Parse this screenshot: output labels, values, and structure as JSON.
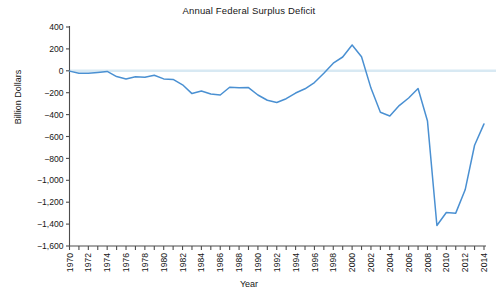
{
  "chart_data": {
    "type": "line",
    "title": "Annual Federal Surplus Deficit",
    "xlabel": "Year",
    "ylabel": "Billion Dollars",
    "grid": false,
    "legend": null,
    "legend_position": "none",
    "line_color": "#4a90d2",
    "zero_line_color": "#d8e9f3",
    "axis_color": "#4d4d4d",
    "xlim": [
      1970,
      2014
    ],
    "ylim": [
      -1600,
      400
    ],
    "x_tick_step": 1,
    "x_label_step": 2,
    "y_tick_step": 200,
    "x": [
      1970,
      1971,
      1972,
      1973,
      1974,
      1975,
      1976,
      1977,
      1978,
      1979,
      1980,
      1981,
      1982,
      1983,
      1984,
      1985,
      1986,
      1987,
      1988,
      1989,
      1990,
      1991,
      1992,
      1993,
      1994,
      1995,
      1996,
      1997,
      1998,
      1999,
      2000,
      2001,
      2002,
      2003,
      2004,
      2005,
      2006,
      2007,
      2008,
      2009,
      2010,
      2011,
      2012,
      2013,
      2014
    ],
    "values": [
      -3,
      -23,
      -23,
      -15,
      -6,
      -53,
      -74,
      -54,
      -59,
      -41,
      -74,
      -79,
      -128,
      -208,
      -185,
      -212,
      -221,
      -150,
      -155,
      -153,
      -221,
      -269,
      -290,
      -255,
      -203,
      -164,
      -107,
      -22,
      69,
      126,
      236,
      128,
      -158,
      -378,
      -413,
      -318,
      -248,
      -161,
      -459,
      -1413,
      -1294,
      -1300,
      -1087,
      -680,
      -485
    ],
    "xtick_labels": [
      "1970",
      "1972",
      "1974",
      "1976",
      "1978",
      "1980",
      "1982",
      "1984",
      "1986",
      "1988",
      "1990",
      "1992",
      "1994",
      "1996",
      "1998",
      "2000",
      "2002",
      "2004",
      "2006",
      "2008",
      "2010",
      "2012",
      "2014"
    ],
    "ytick_labels": [
      "400",
      "200",
      "0",
      "−200",
      "−400",
      "−600",
      "−800",
      "−1,000",
      "−1,200",
      "−1,400",
      "−1,600"
    ],
    "ytick_values": [
      400,
      200,
      0,
      -200,
      -400,
      -600,
      -800,
      -1000,
      -1200,
      -1400,
      -1600
    ]
  }
}
